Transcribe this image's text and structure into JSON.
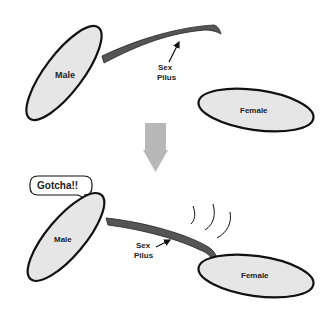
{
  "diagram": {
    "top_panel": {
      "male_label": "Male",
      "female_label": "Female",
      "pilus_label_line1": "Sex",
      "pilus_label_line2": "Pilus"
    },
    "transition_arrow": "down-arrow",
    "bottom_panel": {
      "male_label": "Male",
      "female_label": "Female",
      "pilus_label_line1": "Sex",
      "pilus_label_line2": "Pilus",
      "speech_bubble": "Gotcha!!"
    },
    "colors": {
      "cell_fill": "#e6e6e6",
      "outline": "#111111",
      "pilus": "#555555",
      "arrow": "#b8b8b8"
    }
  }
}
